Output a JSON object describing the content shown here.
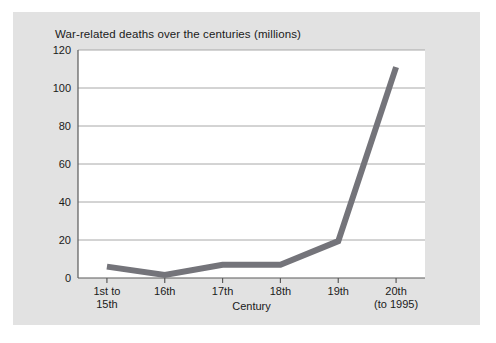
{
  "figure": {
    "panel_bg": "#e2e2e2",
    "plot_bg": "#ffffff",
    "page_bg": "#ffffff"
  },
  "chart_data": {
    "type": "line",
    "title": "War-related deaths over the centuries (millions)",
    "xlabel": "Century",
    "ylabel": "",
    "categories": [
      "1st to\n15th",
      "16th",
      "17th",
      "18th",
      "19th",
      "20th\n(to 1995)"
    ],
    "values": [
      6,
      1.6,
      7,
      7,
      19.4,
      111
    ],
    "ylim": [
      0,
      120
    ],
    "yticks": [
      0,
      20,
      40,
      60,
      80,
      100,
      120
    ],
    "ytick_labels": [
      "0",
      "20",
      "40",
      "60",
      "80",
      "100",
      "120"
    ],
    "grid": true,
    "grid_axis": "y",
    "legend": false,
    "line_color": "#74747a",
    "line_width": 6,
    "axis_color": "#5a5a5a",
    "grid_color": "#a8a8a8"
  }
}
